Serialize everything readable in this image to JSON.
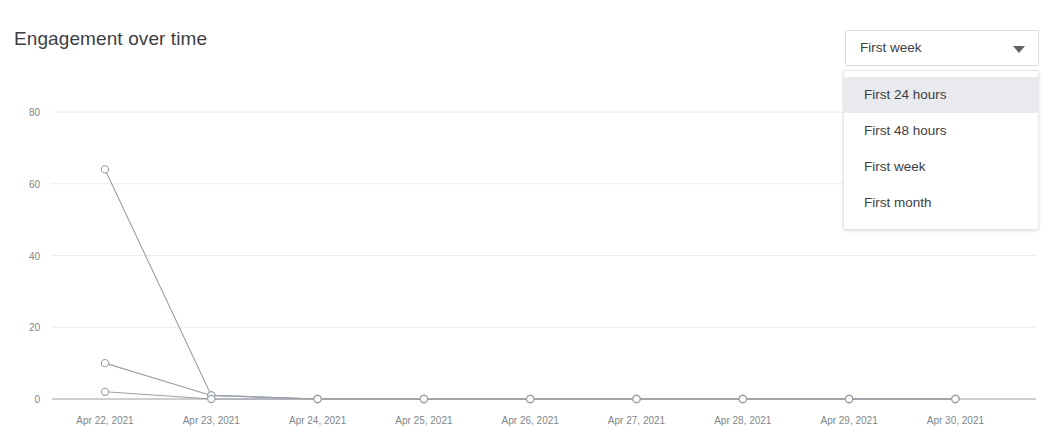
{
  "header": {
    "title": "Engagement over time"
  },
  "range_select": {
    "name": "range-select",
    "selected": "First week",
    "caret_icon": "chevron-down-icon",
    "expanded": true,
    "options": [
      {
        "label": "First 24 hours",
        "highlighted": true
      },
      {
        "label": "First 48 hours",
        "highlighted": false
      },
      {
        "label": "First week",
        "highlighted": false
      },
      {
        "label": "First month",
        "highlighted": false
      }
    ]
  },
  "colors": {
    "text_primary": "#3c4043",
    "text_muted": "#80868b",
    "gridline": "#ececec",
    "axis_line": "#9aa0a6",
    "series_line": "#9aa0a6",
    "marker_fill": "#ffffff",
    "menu_highlight": "#e8eaed",
    "border": "#dadce0"
  },
  "chart_data": {
    "type": "line",
    "title": "Engagement over time",
    "xlabel": "",
    "ylabel": "",
    "grid": true,
    "legend": "none",
    "ylim": [
      0,
      88
    ],
    "yticks": [
      0,
      20,
      40,
      60,
      80
    ],
    "x": [
      "Apr 22, 2021",
      "Apr 23, 2021",
      "Apr 24, 2021",
      "Apr 25, 2021",
      "Apr 26, 2021",
      "Apr 27, 2021",
      "Apr 28, 2021",
      "Apr 29, 2021",
      "Apr 30, 2021"
    ],
    "series": [
      {
        "name": "Series 1",
        "values": [
          64,
          1,
          0,
          0,
          0,
          0,
          0,
          0,
          0
        ]
      },
      {
        "name": "Series 2",
        "values": [
          10,
          1,
          0,
          0,
          0,
          0,
          0,
          0,
          0
        ]
      },
      {
        "name": "Series 3",
        "values": [
          2,
          0,
          0,
          0,
          0,
          0,
          0,
          0,
          0
        ]
      }
    ]
  }
}
